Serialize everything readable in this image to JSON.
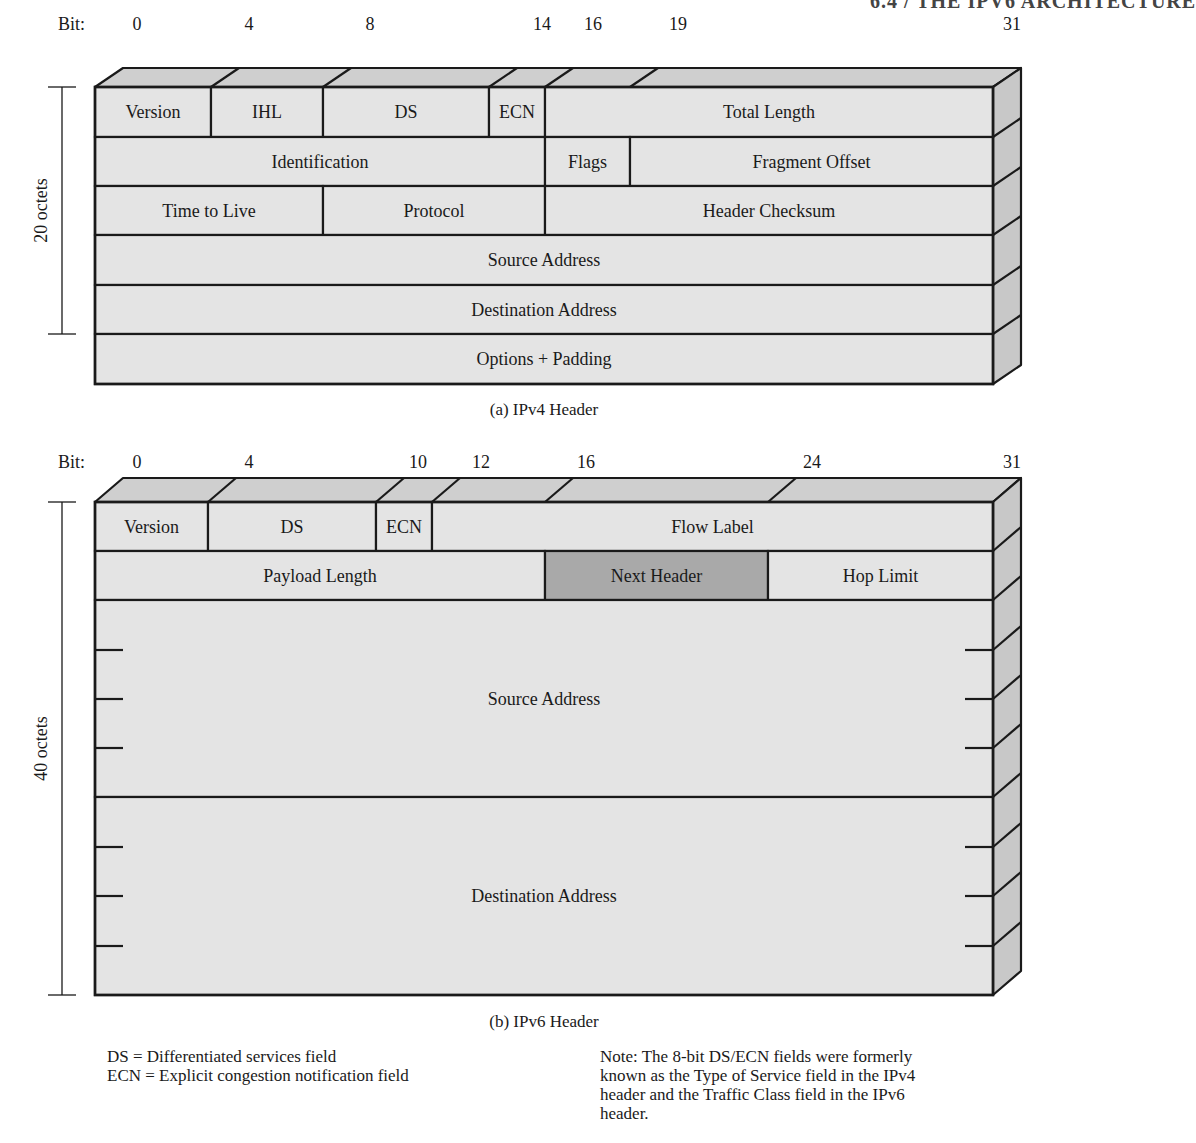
{
  "page_header": "6.4 / THE IPV6 ARCHITECTURE",
  "ipv4": {
    "bit_label": "Bit:",
    "bit_ticks": [
      {
        "label": "0",
        "x": 137
      },
      {
        "label": "4",
        "x": 249
      },
      {
        "label": "8",
        "x": 370
      },
      {
        "label": "14",
        "x": 542
      },
      {
        "label": "16",
        "x": 593
      },
      {
        "label": "19",
        "x": 678
      },
      {
        "label": "31",
        "x": 1012
      }
    ],
    "octets_label": "20 octets",
    "rows": [
      [
        {
          "label": "Version",
          "from": 95,
          "to": 211
        },
        {
          "label": "IHL",
          "from": 211,
          "to": 323
        },
        {
          "label": "DS",
          "from": 323,
          "to": 489
        },
        {
          "label": "ECN",
          "from": 489,
          "to": 545
        },
        {
          "label": "Total Length",
          "from": 545,
          "to": 993
        }
      ],
      [
        {
          "label": "Identification",
          "from": 95,
          "to": 545
        },
        {
          "label": "Flags",
          "from": 545,
          "to": 630
        },
        {
          "label": "Fragment Offset",
          "from": 630,
          "to": 993
        }
      ],
      [
        {
          "label": "Time to Live",
          "from": 95,
          "to": 323
        },
        {
          "label": "Protocol",
          "from": 323,
          "to": 545
        },
        {
          "label": "Header Checksum",
          "from": 545,
          "to": 993
        }
      ],
      [
        {
          "label": "Source Address",
          "from": 95,
          "to": 993
        }
      ],
      [
        {
          "label": "Destination Address",
          "from": 95,
          "to": 993
        }
      ],
      [
        {
          "label": "Options + Padding",
          "from": 95,
          "to": 993
        }
      ]
    ],
    "caption": "(a) IPv4 Header"
  },
  "ipv6": {
    "bit_label": "Bit:",
    "bit_ticks": [
      {
        "label": "0",
        "x": 137
      },
      {
        "label": "4",
        "x": 249
      },
      {
        "label": "10",
        "x": 418
      },
      {
        "label": "12",
        "x": 481
      },
      {
        "label": "16",
        "x": 586
      },
      {
        "label": "24",
        "x": 812
      },
      {
        "label": "31",
        "x": 1012
      }
    ],
    "octets_label": "40 octets",
    "rows": [
      [
        {
          "label": "Version",
          "from": 95,
          "to": 208
        },
        {
          "label": "DS",
          "from": 208,
          "to": 376
        },
        {
          "label": "ECN",
          "from": 376,
          "to": 432
        },
        {
          "label": "Flow Label",
          "from": 432,
          "to": 993
        }
      ],
      [
        {
          "label": "Payload Length",
          "from": 95,
          "to": 545
        },
        {
          "label": "Next Header",
          "from": 545,
          "to": 768,
          "highlight": true
        },
        {
          "label": "Hop Limit",
          "from": 768,
          "to": 993
        }
      ],
      [
        {
          "label": "Source Address",
          "from": 95,
          "to": 993
        }
      ],
      [
        {
          "label": "Destination Address",
          "from": 95,
          "to": 993
        }
      ]
    ],
    "caption": "(b) IPv6 Header"
  },
  "legend": {
    "lines": [
      "DS = Differentiated services field",
      "ECN = Explicit congestion notification field"
    ]
  },
  "note": {
    "lines": [
      "Note: The 8-bit DS/ECN fields were formerly",
      "known as the Type of Service field in the IPv4",
      "header and the Traffic Class field in the IPv6",
      "header."
    ]
  },
  "colors": {
    "front": "#e4e4e4",
    "top": "#cfcfcf",
    "side": "#c8c8c8",
    "highlight": "#a9a9a9",
    "stroke": "#1a1a1a"
  }
}
